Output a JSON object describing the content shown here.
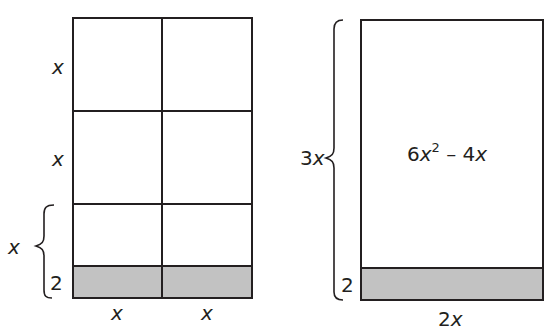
{
  "left_figure": {
    "description": "Rectangle divided into a 2-column grid of x-by-x squares plus a shaded strip of height 2",
    "row_labels": [
      "x",
      "x",
      "x"
    ],
    "strip_label": "2",
    "column_labels": [
      "x",
      "x"
    ],
    "brace_label": "x"
  },
  "right_figure": {
    "description": "Rectangle with height 3x (brace) and width 2x, unshaded area 6x^2 - 4x, shaded strip of height 2",
    "height_label": "3x",
    "height_label_coeff": "3",
    "height_label_var": "x",
    "area_label": {
      "coeff": "6",
      "var": "x",
      "exponent": "2",
      "rest": " – 4",
      "rest_var": "x"
    },
    "strip_label": "2",
    "width_label_coeff": "2",
    "width_label_var": "x"
  },
  "colors": {
    "line": "#231f20",
    "shade": "#c2c2c2",
    "background": "#ffffff"
  }
}
